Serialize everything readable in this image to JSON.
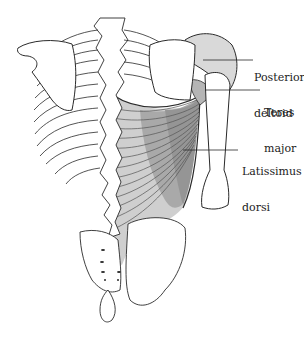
{
  "figure": {
    "labels": [
      {
        "id": "posterior_deltoid",
        "line1": "Posterior",
        "line2": "deltoid"
      },
      {
        "id": "teres_major",
        "line1": "Teres",
        "line2": "major"
      },
      {
        "id": "latissimus_dorsi",
        "line1": "Latissimus",
        "line2": "dorsi"
      }
    ],
    "colors": {
      "outline": "#2a2a2a",
      "muscle_light": "#cfcfcf",
      "muscle_mid": "#b8b8b8",
      "muscle_dark": "#9a9a9a",
      "deltoid_fill": "#d9d9d9",
      "background": "#ffffff"
    }
  }
}
